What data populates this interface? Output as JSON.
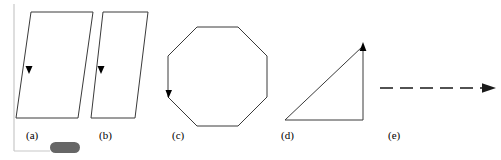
{
  "figure": {
    "background_color": "#ffffff",
    "stroke_color": "#3a3a3a",
    "frame_color": "#c8c8c8",
    "pill_color": "#666666",
    "label_color": "#000000",
    "width": 501,
    "height": 160
  },
  "frame": {
    "name": "page-edge-frame",
    "vertical_line_x": 14,
    "vertical_line_top": 4,
    "vertical_line_bottom": 151,
    "horizontal_line_y": 151,
    "horizontal_line_left": 14,
    "horizontal_line_right": 50
  },
  "pill": {
    "name": "selection-pill",
    "x": 50,
    "y": 142,
    "width": 30,
    "height": 11,
    "radius": 5.5,
    "color": "#666666"
  },
  "panels": [
    {
      "key": "a",
      "label": "(a)",
      "label_x": 26,
      "label_y": 130,
      "shape": "parallelogram",
      "points": "31,12 93,12 78,118 16,118",
      "marker": {
        "type": "arrowhead-down",
        "x": 29,
        "y": 72
      }
    },
    {
      "key": "b",
      "label": "(b)",
      "label_x": 99,
      "label_y": 130,
      "shape": "parallelogram",
      "points": "103,12 148,12 135,118 91,118",
      "marker": {
        "type": "arrowhead-down",
        "x": 101,
        "y": 72
      }
    },
    {
      "key": "c",
      "label": "(c)",
      "label_x": 172,
      "label_y": 130,
      "shape": "octagon",
      "points": "197,27 238,27 267,56 267,97 238,126 197,126 168,97 168,56",
      "marker": {
        "type": "arrowhead-down",
        "x": 169,
        "y": 96
      }
    },
    {
      "key": "d",
      "label": "(d)",
      "label_x": 281,
      "label_y": 130,
      "shape": "right-triangle",
      "points": "285,120 363,120 363,46",
      "marker": {
        "type": "arrowhead-up",
        "x": 363,
        "y": 46
      }
    },
    {
      "key": "e",
      "label": "(e)",
      "label_x": 388,
      "label_y": 130,
      "shape": "dashed-arrow",
      "x1": 380,
      "x2": 482,
      "y": 88,
      "dash_pattern": "13,7",
      "arrow_tip_x": 496
    }
  ]
}
